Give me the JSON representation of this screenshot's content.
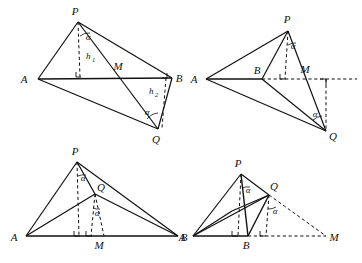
{
  "sheet": {
    "title": "Four geometric tetrahedron/triangle configurations",
    "background": "#ffffff",
    "stroke_color": "#111111",
    "figure_count": 4
  },
  "figures": [
    {
      "id": "figure-1",
      "position": "top-left",
      "vertex_labels": [
        "P",
        "A",
        "M",
        "B",
        "Q"
      ],
      "segment_labels": [
        "h",
        "h"
      ],
      "height_labels": [
        {
          "base": "h",
          "sub": "1"
        },
        {
          "base": "h",
          "sub": "2"
        }
      ],
      "angle_labels": [
        "α",
        "α"
      ],
      "points": {
        "P": {
          "x": 78,
          "y": 22,
          "label": "P",
          "label_x": 75,
          "label_y": 15
        },
        "A": {
          "x": 38,
          "y": 79,
          "label": "A",
          "label_x": 24,
          "label_y": 83
        },
        "B": {
          "x": 172,
          "y": 78,
          "label": "B",
          "label_x": 177,
          "label_y": 82
        },
        "Q": {
          "x": 158,
          "y": 129,
          "label": "Q",
          "label_x": 155,
          "label_y": 142
        },
        "M": {
          "x": 121,
          "y": 77,
          "label": "M",
          "label_x": 114,
          "label_y": 70
        }
      }
    },
    {
      "id": "figure-2",
      "position": "top-right",
      "vertex_labels": [
        "P",
        "A",
        "B",
        "M",
        "Q"
      ],
      "angle_labels": [
        "α",
        "α"
      ],
      "points": {
        "P": {
          "x": 288,
          "y": 31,
          "label": "P",
          "label_x": 286,
          "label_y": 23
        },
        "A": {
          "x": 206,
          "y": 79,
          "label": "A",
          "label_x": 193,
          "label_y": 83
        },
        "B": {
          "x": 262,
          "y": 79,
          "label": "B",
          "label_x": 256,
          "label_y": 74
        },
        "M": {
          "x": 310,
          "y": 79,
          "label": "M",
          "label_x": 303,
          "label_y": 73
        },
        "Q": {
          "x": 326,
          "y": 131,
          "label": "Q",
          "label_x": 330,
          "label_y": 139
        }
      }
    },
    {
      "id": "figure-3",
      "position": "bottom-left",
      "vertex_labels": [
        "P",
        "Q",
        "A",
        "M",
        "B"
      ],
      "angle_labels": [
        "α",
        "α"
      ],
      "points": {
        "P": {
          "x": 77,
          "y": 162,
          "label": "P",
          "label_x": 74,
          "label_y": 155
        },
        "Q": {
          "x": 95,
          "y": 194,
          "label": "Q",
          "label_x": 99,
          "label_y": 190
        },
        "A": {
          "x": 26,
          "y": 236,
          "label": "A",
          "label_x": 14,
          "label_y": 241
        },
        "B": {
          "x": 178,
          "y": 236,
          "label": "B",
          "label_x": 182,
          "label_y": 241
        },
        "M": {
          "x": 104,
          "y": 236,
          "label": "M",
          "label_x": 98,
          "label_y": 248
        }
      }
    },
    {
      "id": "figure-4",
      "position": "bottom-right",
      "vertex_labels": [
        "P",
        "Q",
        "A",
        "B",
        "M"
      ],
      "angle_labels": [
        "α",
        "α"
      ],
      "points": {
        "P": {
          "x": 241,
          "y": 174,
          "label": "P",
          "label_x": 237,
          "label_y": 167
        },
        "Q": {
          "x": 269,
          "y": 195,
          "label": "Q",
          "label_x": 272,
          "label_y": 190
        },
        "A": {
          "x": 193,
          "y": 236,
          "label": "A",
          "label_x": 182,
          "label_y": 241
        },
        "B": {
          "x": 248,
          "y": 236,
          "label": "B",
          "label_x": 243,
          "label_y": 248
        },
        "M": {
          "x": 326,
          "y": 236,
          "label": "M",
          "label_x": 331,
          "label_y": 241
        }
      }
    }
  ],
  "glyphs": {
    "alpha": "α",
    "h": "h",
    "one": "1",
    "two": "2",
    "P": "P",
    "Q": "Q",
    "A": "A",
    "B": "B",
    "M": "M"
  }
}
